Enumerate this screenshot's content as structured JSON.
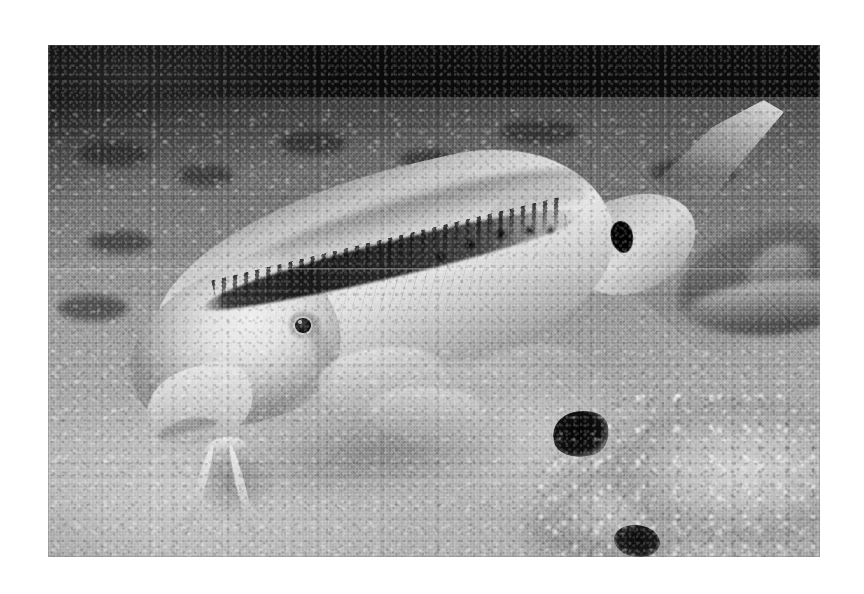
{
  "page": {
    "background_color": "#ffffff",
    "width": 864,
    "height": 594
  },
  "photo": {
    "name": "goatfish-foraging-photograph",
    "medium": "black-and-white underwater photograph",
    "frame": {
      "left": 48,
      "top": 45,
      "width": 772,
      "height": 512
    },
    "border_color": "#ffffff",
    "caption": "",
    "palette": {
      "deep_shadow": "#0a0a0a",
      "dark_substrate": "#3a3a3a",
      "mid_sediment": "#7f7f7f",
      "sand": "#aeaeae",
      "bright_sand": "#c6c6c6",
      "fish_flank": "#e6e6e6",
      "stripe_dark": "#1a1a1a",
      "spot_black": "#000000"
    },
    "scene": {
      "description": "A goatfish hovers head-down over a sandy rubble seabed at night, barbels probing the sediment; a second fish rests blurred in the background at right.",
      "regions": [
        {
          "name": "dark-water-band",
          "label": "Dark water and shaded slope across the top of the frame"
        },
        {
          "name": "sediment-slope",
          "label": "Coarse dark sediment slope in the upper third"
        },
        {
          "name": "sand-floor",
          "label": "Pale sand and gravel floor across the lower half"
        },
        {
          "name": "sediment-plume",
          "label": "Suspended sediment plume stirred up beneath the fish"
        },
        {
          "name": "coral-rubble-mound",
          "label": "Encrusted coral rubble mound at lower right"
        },
        {
          "name": "background-fish",
          "label": "Blurred second fish resting at right"
        }
      ]
    },
    "subject": {
      "name": "goatfish",
      "common_name": "Goatfish",
      "orientation": "head down and to the left, tail up and to the right",
      "features": [
        {
          "name": "lateral-stripe",
          "label": "Dark lateral stripe from eye to caudal peduncle"
        },
        {
          "name": "caudal-spot",
          "label": "Solid black spot on the caudal peduncle"
        },
        {
          "name": "chin-barbels",
          "label": "Pair of pale chin barbels splayed into the sand"
        },
        {
          "name": "eye",
          "label": "Dark round eye on the pale head"
        },
        {
          "name": "dorsal-fins",
          "label": "Two low dorsal fins along the back"
        },
        {
          "name": "pectoral-fin",
          "label": "Translucent pectoral fin on the flank"
        },
        {
          "name": "pelvic-fin",
          "label": "Pale pelvic fin below the belly"
        },
        {
          "name": "caudal-fin",
          "label": "Forked caudal fin with a long upper lobe"
        }
      ]
    }
  }
}
